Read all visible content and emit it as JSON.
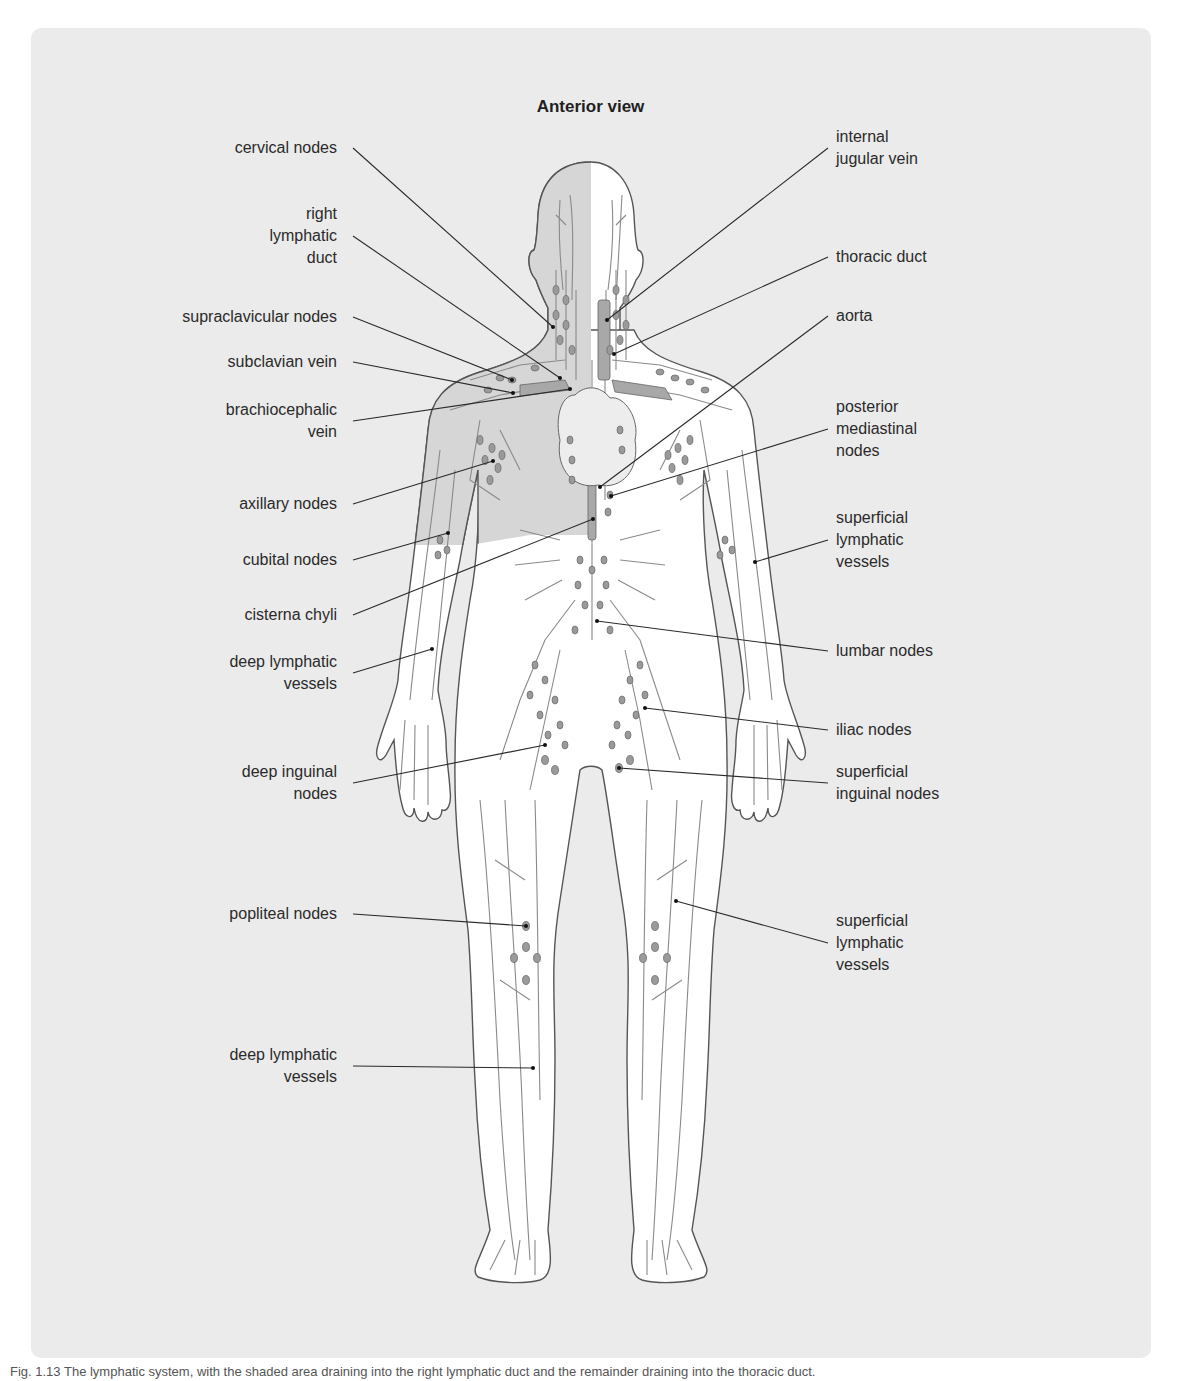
{
  "figure": {
    "title": "Anterior view",
    "colors": {
      "panel_bg": "#ebebeb",
      "body_fill": "#ffffff",
      "shaded_region": "#d9d9d9",
      "outline": "#555555",
      "vessel": "#8a8a8a",
      "node_fill": "#9a9a9a",
      "duct_fill": "#a8a8a8",
      "leader_line": "#2a2a2a"
    }
  },
  "labels_left": [
    {
      "id": "cervical-nodes",
      "text": "cervical nodes",
      "x": 345,
      "y": 148,
      "target": [
        553,
        327
      ]
    },
    {
      "id": "right-lymphatic-duct",
      "text": "right\nlymphatic\nduct",
      "x": 345,
      "y": 236,
      "target": [
        560,
        378
      ]
    },
    {
      "id": "supraclavicular-nodes",
      "text": "supraclavicular nodes",
      "x": 345,
      "y": 317,
      "target": [
        512,
        380
      ]
    },
    {
      "id": "subclavian-vein",
      "text": "subclavian vein",
      "x": 345,
      "y": 362,
      "target": [
        513,
        393
      ]
    },
    {
      "id": "brachiocephalic-vein",
      "text": "brachiocephalic\nvein",
      "x": 345,
      "y": 421,
      "target": [
        570,
        389
      ]
    },
    {
      "id": "axillary-nodes",
      "text": "axillary nodes",
      "x": 345,
      "y": 504,
      "target": [
        493,
        461
      ]
    },
    {
      "id": "cubital-nodes",
      "text": "cubital nodes",
      "x": 345,
      "y": 560,
      "target": [
        448,
        533
      ]
    },
    {
      "id": "cisterna-chyli",
      "text": "cisterna chyli",
      "x": 345,
      "y": 615,
      "target": [
        593,
        519
      ]
    },
    {
      "id": "deep-lymphatic-vessels-arm",
      "text": "deep lymphatic\nvessels",
      "x": 345,
      "y": 673,
      "target": [
        432,
        649
      ]
    },
    {
      "id": "deep-inguinal-nodes",
      "text": "deep inguinal\nnodes",
      "x": 345,
      "y": 783,
      "target": [
        545,
        745
      ]
    },
    {
      "id": "popliteal-nodes",
      "text": "popliteal nodes",
      "x": 345,
      "y": 914,
      "target": [
        526,
        926
      ]
    },
    {
      "id": "deep-lymphatic-vessels-leg",
      "text": "deep lymphatic\nvessels",
      "x": 345,
      "y": 1066,
      "target": [
        533,
        1068
      ]
    }
  ],
  "labels_right": [
    {
      "id": "internal-jugular-vein",
      "text": "internal\njugular vein",
      "x": 836,
      "y": 148,
      "target": [
        607,
        320
      ]
    },
    {
      "id": "thoracic-duct",
      "text": "thoracic duct",
      "x": 836,
      "y": 257,
      "target": [
        614,
        354
      ]
    },
    {
      "id": "aorta",
      "text": "aorta",
      "x": 836,
      "y": 316,
      "target": [
        600,
        487
      ]
    },
    {
      "id": "posterior-mediastinal-nodes",
      "text": "posterior\nmediastinal\nnodes",
      "x": 836,
      "y": 429,
      "target": [
        611,
        496
      ]
    },
    {
      "id": "superficial-lymphatic-vessels-arm",
      "text": "superficial\nlymphatic\nvessels",
      "x": 836,
      "y": 540,
      "target": [
        755,
        562
      ]
    },
    {
      "id": "lumbar-nodes",
      "text": "lumbar nodes",
      "x": 836,
      "y": 651,
      "target": [
        597,
        621
      ]
    },
    {
      "id": "iliac-nodes",
      "text": "iliac nodes",
      "x": 836,
      "y": 730,
      "target": [
        645,
        708
      ]
    },
    {
      "id": "superficial-inguinal-nodes",
      "text": "superficial\ninguinal nodes",
      "x": 836,
      "y": 783,
      "target": [
        619,
        768
      ]
    },
    {
      "id": "superficial-lymphatic-vessels-leg",
      "text": "superficial\nlymphatic\nvessels",
      "x": 836,
      "y": 943,
      "target": [
        676,
        901
      ]
    }
  ],
  "caption": "Fig. 1.13   The lymphatic system, with the shaded area draining into the right lymphatic duct and the remainder draining into the thoracic duct."
}
